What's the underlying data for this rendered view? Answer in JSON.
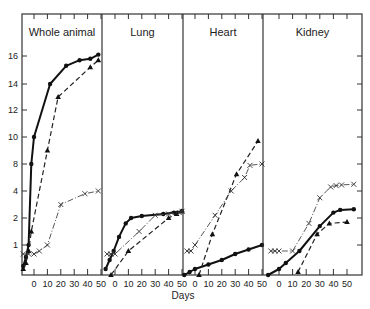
{
  "chart_data": {
    "type": "line",
    "xlabel": "Days",
    "ylabel": "",
    "y_ticks": [
      1,
      2,
      4,
      8,
      10,
      12,
      14,
      16
    ],
    "y_tick_pixels": [
      245,
      218,
      191,
      164,
      137,
      110,
      84,
      56
    ],
    "x_ticks": [
      0,
      10,
      20,
      30,
      40,
      50
    ],
    "grid": false,
    "legend": "none",
    "series_styles": {
      "circles": {
        "marker": "dot",
        "line": "solid-thick"
      },
      "triangles": {
        "marker": "triangle",
        "line": "dashed"
      },
      "crosses": {
        "marker": "x",
        "line": "dash-dot-thin"
      }
    },
    "panels": [
      {
        "title": "Whole animal",
        "x_left": 22,
        "x_right": 102,
        "x_zero": 34,
        "px_per_10": 13.4,
        "series": [
          {
            "name": "circles",
            "points": [
              [
                -8,
                0.3
              ],
              [
                -6,
                0.6
              ],
              [
                -4,
                1
              ],
              [
                -2,
                8
              ],
              [
                0,
                10
              ],
              [
                12,
                14
              ],
              [
                24,
                15.3
              ],
              [
                34,
                15.7
              ],
              [
                42,
                15.8
              ],
              [
                48,
                16.1
              ]
            ]
          },
          {
            "name": "triangles",
            "points": [
              [
                -8,
                0.2
              ],
              [
                -6,
                0.4
              ],
              [
                -4,
                0.8
              ],
              [
                -2,
                1.5
              ],
              [
                10,
                9
              ],
              [
                18,
                13
              ],
              [
                42,
                15.2
              ],
              [
                48,
                15.7
              ]
            ]
          },
          {
            "name": "crosses",
            "points": [
              [
                -8,
                0.7
              ],
              [
                -4,
                0.7
              ],
              [
                0,
                0.7
              ],
              [
                4,
                0.8
              ],
              [
                10,
                1
              ],
              [
                20,
                3
              ],
              [
                38,
                3.8
              ],
              [
                48,
                4
              ]
            ]
          }
        ]
      },
      {
        "title": "Lung",
        "x_left": 102,
        "x_right": 183,
        "x_zero": 115,
        "px_per_10": 13.4,
        "series": [
          {
            "name": "circles",
            "points": [
              [
                -7,
                0.2
              ],
              [
                -4,
                0.5
              ],
              [
                -1,
                0.8
              ],
              [
                3,
                1.3
              ],
              [
                8,
                1.8
              ],
              [
                12,
                2.0
              ],
              [
                20,
                2.15
              ],
              [
                36,
                2.3
              ],
              [
                44,
                2.4
              ],
              [
                50,
                2.5
              ]
            ]
          },
          {
            "name": "triangles",
            "points": [
              [
                -3,
                0.0
              ],
              [
                10,
                0.8
              ],
              [
                40,
                2.0
              ],
              [
                46,
                2.3
              ],
              [
                50,
                2.5
              ]
            ]
          },
          {
            "name": "crosses",
            "points": [
              [
                -6,
                0.7
              ],
              [
                -3,
                0.7
              ],
              [
                0,
                0.7
              ],
              [
                18,
                1.5
              ],
              [
                30,
                2.2
              ],
              [
                40,
                2.3
              ],
              [
                48,
                2.4
              ],
              [
                50,
                2.5
              ]
            ]
          }
        ]
      },
      {
        "title": "Heart",
        "x_left": 183,
        "x_right": 263,
        "x_zero": 195,
        "px_per_10": 13.4,
        "series": [
          {
            "name": "circles",
            "points": [
              [
                -8,
                0.0
              ],
              [
                -4,
                0.1
              ],
              [
                0,
                0.2
              ],
              [
                10,
                0.35
              ],
              [
                20,
                0.5
              ],
              [
                30,
                0.7
              ],
              [
                40,
                0.85
              ],
              [
                50,
                1.0
              ]
            ]
          },
          {
            "name": "triangles",
            "points": [
              [
                3,
                0.0
              ],
              [
                13,
                1.4
              ],
              [
                31,
                6.5
              ],
              [
                47,
                9.7
              ]
            ]
          },
          {
            "name": "crosses",
            "points": [
              [
                -6,
                0.8
              ],
              [
                -3,
                0.8
              ],
              [
                0,
                1.0
              ],
              [
                15,
                2.2
              ],
              [
                27,
                4
              ],
              [
                37,
                6
              ],
              [
                41,
                7.8
              ],
              [
                50,
                8.0
              ]
            ]
          }
        ]
      },
      {
        "title": "Kidney",
        "x_left": 263,
        "x_right": 362,
        "x_zero": 279,
        "px_per_10": 13.6,
        "series": [
          {
            "name": "circles",
            "points": [
              [
                -8,
                0.0
              ],
              [
                0,
                0.2
              ],
              [
                5,
                0.4
              ],
              [
                15,
                0.8
              ],
              [
                30,
                1.7
              ],
              [
                40,
                2.4
              ],
              [
                45,
                2.6
              ],
              [
                55,
                2.65
              ]
            ]
          },
          {
            "name": "triangles",
            "points": [
              [
                14,
                0.1
              ],
              [
                28,
                1.4
              ],
              [
                37,
                1.8
              ],
              [
                50,
                1.85
              ]
            ]
          },
          {
            "name": "crosses",
            "points": [
              [
                -6,
                0.8
              ],
              [
                -3,
                0.8
              ],
              [
                0,
                0.8
              ],
              [
                10,
                0.8
              ],
              [
                22,
                1.8
              ],
              [
                30,
                3.5
              ],
              [
                38,
                4.6
              ],
              [
                42,
                4.8
              ],
              [
                46,
                4.9
              ],
              [
                55,
                5.0
              ]
            ]
          }
        ]
      }
    ]
  }
}
